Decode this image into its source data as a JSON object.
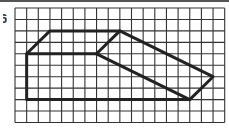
{
  "problem_label": "6",
  "grid": {
    "columns": 18,
    "rows": 10,
    "line_color": "#333333",
    "shape_color": "#222222"
  },
  "figure": {
    "outline": [
      [
        1,
        4
      ],
      [
        3,
        2
      ],
      [
        9,
        2
      ],
      [
        17,
        6
      ],
      [
        15,
        8
      ],
      [
        1,
        8
      ],
      [
        1,
        4
      ]
    ],
    "inner_segments": [
      [
        [
          1,
          4
        ],
        [
          7,
          4
        ]
      ],
      [
        [
          7,
          4
        ],
        [
          9,
          2
        ]
      ],
      [
        [
          7,
          4
        ],
        [
          15,
          8
        ]
      ]
    ]
  }
}
